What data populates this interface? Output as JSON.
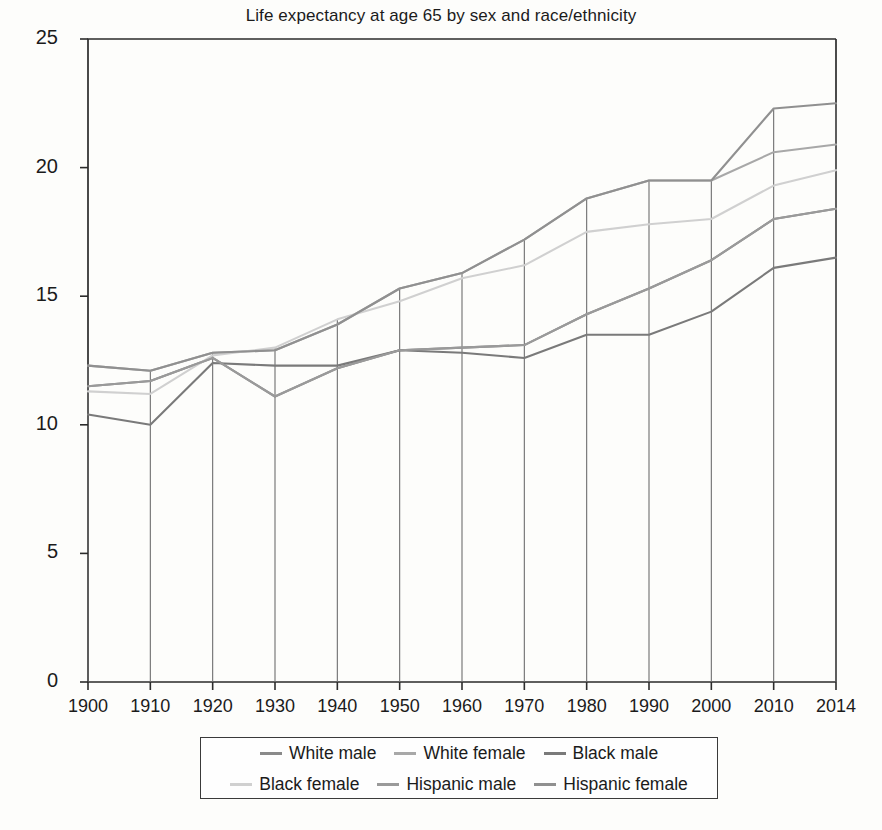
{
  "chart_data": {
    "type": "line",
    "title": "Life expectancy at age 65 by sex and race/ethnicity",
    "xlabel": "",
    "ylabel": "",
    "categories": [
      "1900",
      "1910",
      "1920",
      "1930",
      "1940",
      "1950",
      "1960",
      "1970",
      "1980",
      "1990",
      "2000",
      "2010",
      "2014"
    ],
    "ylim": [
      0,
      25
    ],
    "yticks": [
      0,
      5,
      10,
      15,
      20,
      25
    ],
    "grid": false,
    "legend_position": "bottom",
    "series": [
      {
        "name": "White male",
        "color": "#8a8a8a",
        "values": [
          11.5,
          11.7,
          12.6,
          11.1,
          12.2,
          12.9,
          13.0,
          13.1,
          14.3,
          15.3,
          16.4,
          18.0,
          18.4
        ]
      },
      {
        "name": "White female",
        "color": "#a8a8a8",
        "values": [
          12.3,
          12.1,
          12.8,
          12.9,
          13.9,
          15.3,
          15.9,
          17.2,
          18.8,
          19.5,
          19.5,
          20.6,
          20.9
        ]
      },
      {
        "name": "Black male",
        "color": "#7a7a7a",
        "values": [
          10.4,
          10.0,
          12.4,
          12.3,
          12.3,
          12.9,
          12.8,
          12.6,
          13.5,
          13.5,
          14.4,
          16.1,
          16.5
        ]
      },
      {
        "name": "Black female",
        "color": "#d0d0d0",
        "values": [
          11.3,
          11.2,
          12.7,
          13.0,
          14.1,
          14.8,
          15.7,
          16.2,
          17.5,
          17.8,
          18.0,
          19.3,
          19.9
        ]
      },
      {
        "name": "Hispanic male",
        "color": "#9a9a9a",
        "values": [
          11.5,
          11.7,
          12.6,
          11.1,
          12.2,
          12.9,
          13.0,
          13.1,
          14.3,
          15.3,
          16.4,
          18.0,
          18.4
        ]
      },
      {
        "name": "Hispanic female",
        "color": "#909090",
        "values": [
          12.3,
          12.1,
          12.8,
          12.9,
          13.9,
          15.3,
          15.9,
          17.2,
          18.8,
          19.5,
          19.5,
          22.3,
          22.5
        ]
      }
    ],
    "legend": [
      "White male",
      "White female",
      "Black male",
      "Black female",
      "Hispanic male",
      "Hispanic female"
    ]
  }
}
